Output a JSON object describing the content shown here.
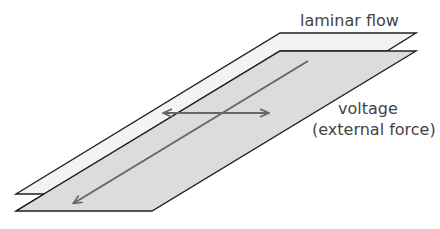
{
  "diagram": {
    "labels": {
      "laminar_flow": "laminar flow",
      "voltage": "voltage",
      "external_force": "(external force)"
    },
    "colors": {
      "upper_sheet_fill": "#f3f3f3",
      "lower_sheet_fill": "#dcdcdc",
      "outline": "#222222",
      "arrow": "#666666",
      "text": "#444444"
    },
    "elements": {
      "upper_sheet": "laminar flow layer (top)",
      "lower_sheet": "laminar flow layer (bottom)",
      "flow_arrow": "diagonal arrow along sheet direction",
      "transverse_arrow": "horizontal double-headed arrow"
    }
  }
}
